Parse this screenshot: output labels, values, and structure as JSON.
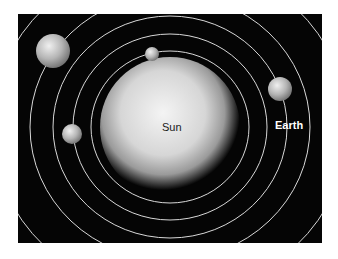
{
  "diagram": {
    "type": "solar-system",
    "background": "#050505",
    "orbit_color": "#d8d8d8",
    "sun": {
      "label": "Sun",
      "cx": 170,
      "cy": 127,
      "r": 63
    },
    "orbits": [
      {
        "rx": 79,
        "ry": 76
      },
      {
        "rx": 97,
        "ry": 93
      },
      {
        "rx": 117,
        "ry": 111
      },
      {
        "rx": 140,
        "ry": 133
      },
      {
        "rx": 178,
        "ry": 168
      },
      {
        "rx": 215,
        "ry": 205
      }
    ],
    "planets": [
      {
        "name": "mercury",
        "label": "",
        "cx": 152,
        "cy": 54,
        "r": 7
      },
      {
        "name": "venus",
        "label": "",
        "cx": 72,
        "cy": 134,
        "r": 10
      },
      {
        "name": "earth",
        "label": "Earth",
        "cx": 280,
        "cy": 89,
        "r": 12
      },
      {
        "name": "mars",
        "label": "",
        "cx": 53,
        "cy": 51,
        "r": 17
      }
    ]
  }
}
